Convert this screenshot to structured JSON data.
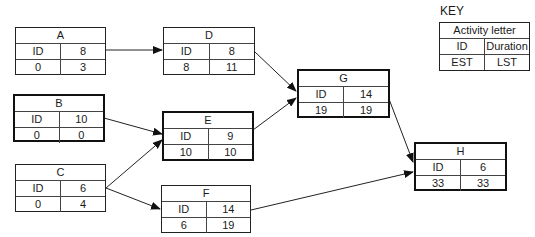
{
  "key": {
    "label": "KEY",
    "title": "Activity letter",
    "row1": [
      "ID",
      "Duration"
    ],
    "row2": [
      "EST",
      "LST"
    ]
  },
  "nodes": {
    "A": {
      "letter": "A",
      "id_label": "ID",
      "duration": "8",
      "est": "0",
      "lst": "3",
      "critical": false
    },
    "B": {
      "letter": "B",
      "id_label": "ID",
      "duration": "10",
      "est": "0",
      "lst": "0",
      "critical": true
    },
    "C": {
      "letter": "C",
      "id_label": "ID",
      "duration": "6",
      "est": "0",
      "lst": "4",
      "critical": false
    },
    "D": {
      "letter": "D",
      "id_label": "ID",
      "duration": "8",
      "est": "8",
      "lst": "11",
      "critical": false
    },
    "E": {
      "letter": "E",
      "id_label": "ID",
      "duration": "9",
      "est": "10",
      "lst": "10",
      "critical": true
    },
    "F": {
      "letter": "F",
      "id_label": "ID",
      "duration": "14",
      "est": "6",
      "lst": "19",
      "critical": false
    },
    "G": {
      "letter": "G",
      "id_label": "ID",
      "duration": "14",
      "est": "19",
      "lst": "19",
      "critical": true
    },
    "H": {
      "letter": "H",
      "id_label": "ID",
      "duration": "6",
      "est": "33",
      "lst": "33",
      "critical": true
    }
  },
  "edges": [
    {
      "from": "A",
      "to": "D"
    },
    {
      "from": "B",
      "to": "E"
    },
    {
      "from": "C",
      "to": "E"
    },
    {
      "from": "C",
      "to": "F"
    },
    {
      "from": "D",
      "to": "G"
    },
    {
      "from": "E",
      "to": "G"
    },
    {
      "from": "G",
      "to": "H"
    },
    {
      "from": "F",
      "to": "H"
    }
  ]
}
